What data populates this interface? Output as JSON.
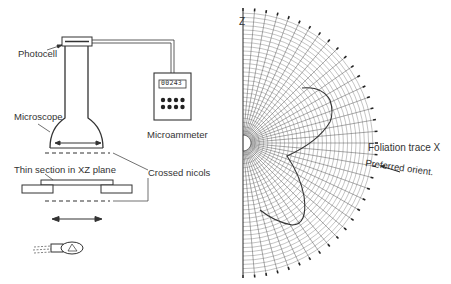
{
  "apparatus": {
    "labels": {
      "photocell": "Photocell",
      "microscope": "Microscope",
      "microammeter": "Microammeter",
      "thin_section": "Thin section in XZ plane",
      "crossed_nicols": "Crossed nicols"
    },
    "meter_display": "00243",
    "meter_buttons": 8
  },
  "polar_plot": {
    "axis_label_top": "Z",
    "label_foliation": "Foliation trace X",
    "label_preferred": "Preferred orient.",
    "center": [
      243,
      143
    ],
    "radius": 132,
    "radial_lines_step_deg": 5,
    "line_color": "#555555",
    "curve_color": "#333333"
  }
}
